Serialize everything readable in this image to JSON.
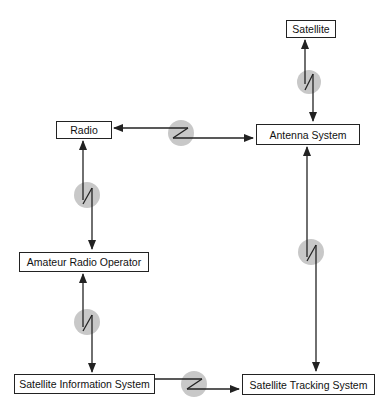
{
  "diagram": {
    "nodes": [
      {
        "id": "satellite",
        "label": "Satellite"
      },
      {
        "id": "radio",
        "label": "Radio"
      },
      {
        "id": "antenna",
        "label": "Antenna System"
      },
      {
        "id": "operator",
        "label": "Amateur Radio Operator"
      },
      {
        "id": "info",
        "label": "Satellite Information System"
      },
      {
        "id": "tracking",
        "label": "Satellite Tracking System"
      }
    ],
    "links": [
      {
        "from": "satellite",
        "to": "antenna",
        "type": "wireless",
        "arrows": "both"
      },
      {
        "from": "radio",
        "to": "antenna",
        "type": "wireless",
        "arrows": "both"
      },
      {
        "from": "radio",
        "to": "operator",
        "type": "wireless",
        "arrows": "both"
      },
      {
        "from": "operator",
        "to": "info",
        "type": "wireless",
        "arrows": "both"
      },
      {
        "from": "antenna",
        "to": "tracking",
        "type": "wireless",
        "arrows": "both"
      },
      {
        "from": "info",
        "to": "tracking",
        "type": "wireless",
        "arrows": "forward"
      }
    ],
    "colors": {
      "line": "#222222",
      "circle": "#c8c8c8"
    }
  }
}
